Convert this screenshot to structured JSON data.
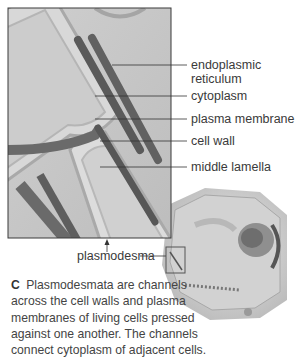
{
  "figure": {
    "panel_letter": "C",
    "labels": {
      "endoplasmic_reticulum_1": "endoplasmic",
      "endoplasmic_reticulum_2": "reticulum",
      "cytoplasm": "cytoplasm",
      "plasma_membrane": "plasma membrane",
      "cell_wall": "cell wall",
      "middle_lamella": "middle lamella",
      "plasmodesma": "plasmodesma"
    },
    "caption": "Plasmodesmata are channels across the cell walls and plasma membranes of living cells pressed against one another. The channels connect cytoplasm of adjacent cells."
  }
}
